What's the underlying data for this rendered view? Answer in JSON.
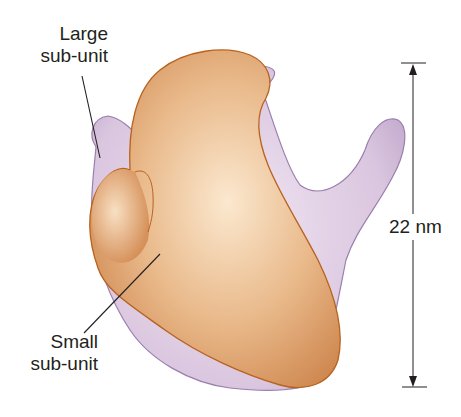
{
  "labels": {
    "large_subunit": [
      "Large",
      "sub-unit"
    ],
    "small_subunit": [
      "Small",
      "sub-unit"
    ],
    "size": "22 nm"
  },
  "colors": {
    "large_subunit_fill": "#dcc8e0",
    "large_subunit_edge": "#9a7fae",
    "small_subunit_fill": "#e6b07e",
    "small_subunit_edge": "#b8621e",
    "text": "#231f20"
  },
  "dimension": {
    "value": 22,
    "unit": "nm"
  }
}
